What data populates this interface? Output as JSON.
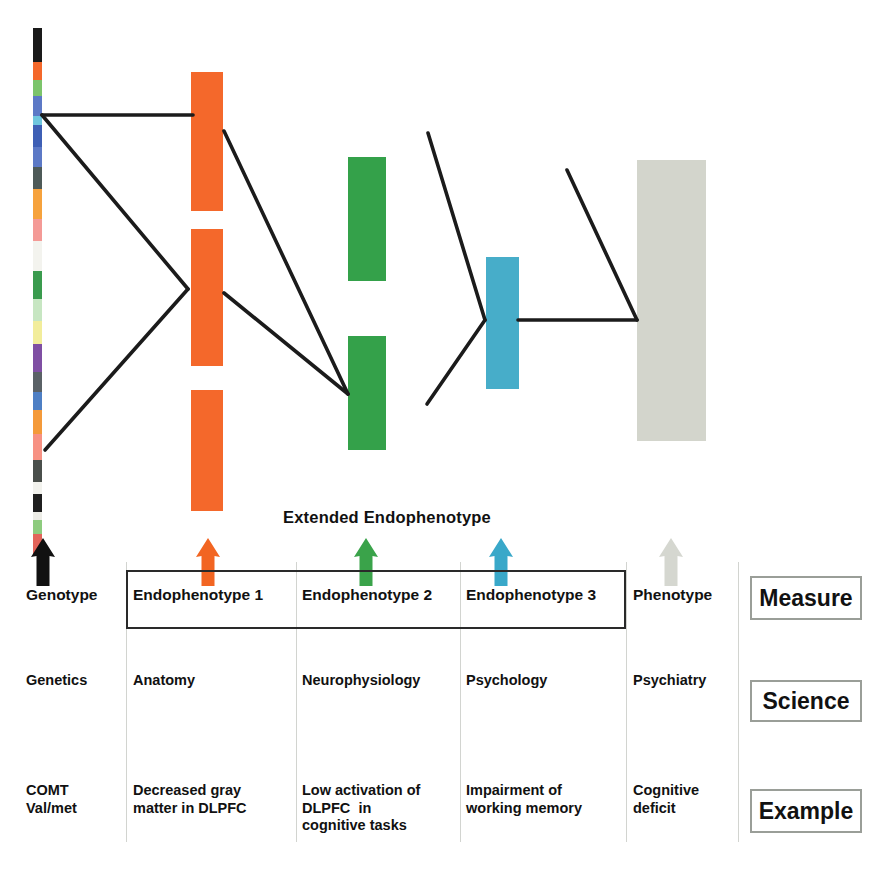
{
  "figure": {
    "title_label": "Extended Endophenotype",
    "columns": [
      {
        "id": "genotype",
        "measure": "Genotype",
        "science": "Genetics",
        "example": "COMT\nVal/met"
      },
      {
        "id": "endophenotype1",
        "measure": "Endophenotype 1",
        "science": "Anatomy",
        "example": "Decreased gray\nmatter in DLPFC"
      },
      {
        "id": "endophenotype2",
        "measure": "Endophenotype 2",
        "science": "Neurophysiology",
        "example": "Low activation of\nDLPFC  in\ncognitive tasks"
      },
      {
        "id": "endophenotype3",
        "measure": "Endophenotype 3",
        "science": "Psychology",
        "example": "Impairment of\nworking memory"
      },
      {
        "id": "phenotype",
        "measure": "Phenotype",
        "science": "Psychiatry",
        "example": "Cognitive\ndeficit"
      }
    ],
    "row_legend": [
      {
        "id": "measure",
        "label": "Measure"
      },
      {
        "id": "science",
        "label": "Science"
      },
      {
        "id": "example",
        "label": "Example"
      }
    ],
    "arrows": [
      {
        "id": "genotype-arrow",
        "color": "#111111",
        "x": 30,
        "y": 538
      },
      {
        "id": "endophenotype1-arrow",
        "color": "#F26522",
        "x": 195,
        "y": 538
      },
      {
        "id": "endophenotype2-arrow",
        "color": "#3AA34A",
        "x": 353,
        "y": 538
      },
      {
        "id": "endophenotype3-arrow",
        "color": "#39A8C9",
        "x": 488,
        "y": 538
      },
      {
        "id": "phenotype-arrow",
        "color": "#D5D7D0",
        "x": 658,
        "y": 538
      }
    ],
    "bars": [
      {
        "id": "endophenotype1-bar-a",
        "color": "#F4682B",
        "x": 191,
        "y": 72,
        "w": 32,
        "h": 139
      },
      {
        "id": "endophenotype1-bar-b",
        "color": "#F4682B",
        "x": 191,
        "y": 229,
        "w": 32,
        "h": 137
      },
      {
        "id": "endophenotype1-bar-c",
        "color": "#F4682B",
        "x": 191,
        "y": 390,
        "w": 32,
        "h": 121
      },
      {
        "id": "endophenotype2-bar-a",
        "color": "#34A14A",
        "x": 348,
        "y": 157,
        "w": 38,
        "h": 124
      },
      {
        "id": "endophenotype2-bar-b",
        "color": "#34A14A",
        "x": 348,
        "y": 336,
        "w": 38,
        "h": 114
      },
      {
        "id": "endophenotype3-bar",
        "color": "#47ADC9",
        "x": 486,
        "y": 257,
        "w": 33,
        "h": 132
      },
      {
        "id": "phenotype-bar",
        "color": "#D3D5CC",
        "x": 637,
        "y": 160,
        "w": 69,
        "h": 281
      }
    ],
    "chromosome_bands": [
      {
        "color": "#1a1a1a",
        "y": 0,
        "h": 34
      },
      {
        "color": "#F4682B",
        "y": 34,
        "h": 18
      },
      {
        "color": "#7CC46B",
        "y": 52,
        "h": 16
      },
      {
        "color": "#5C79C6",
        "y": 68,
        "h": 20
      },
      {
        "color": "#6FC6DE",
        "y": 88,
        "h": 9
      },
      {
        "color": "#3E5FB5",
        "y": 97,
        "h": 22
      },
      {
        "color": "#5C79C6",
        "y": 119,
        "h": 20
      },
      {
        "color": "#4E5A58",
        "y": 139,
        "h": 22
      },
      {
        "color": "#F6A23C",
        "y": 161,
        "h": 30
      },
      {
        "color": "#F49A96",
        "y": 191,
        "h": 22
      },
      {
        "color": "#F3F3EE",
        "y": 213,
        "h": 30
      },
      {
        "color": "#3A9B4E",
        "y": 243,
        "h": 28
      },
      {
        "color": "#C7E6C2",
        "y": 271,
        "h": 22
      },
      {
        "color": "#F2ED9B",
        "y": 293,
        "h": 23
      },
      {
        "color": "#7F4FA3",
        "y": 316,
        "h": 28
      },
      {
        "color": "#5A6166",
        "y": 344,
        "h": 20
      },
      {
        "color": "#4E7FC4",
        "y": 364,
        "h": 18
      },
      {
        "color": "#F49A3A",
        "y": 382,
        "h": 24
      },
      {
        "color": "#F79183",
        "y": 406,
        "h": 26
      },
      {
        "color": "#4A4F4B",
        "y": 432,
        "h": 22
      },
      {
        "color": "#F2F2ED",
        "y": 454,
        "h": 12
      },
      {
        "color": "#1f1f1f",
        "y": 466,
        "h": 18
      },
      {
        "color": "#ECECE6",
        "y": 484,
        "h": 8
      },
      {
        "color": "#8DCB7E",
        "y": 492,
        "h": 14
      },
      {
        "color": "#E2645A",
        "y": 506,
        "h": 21
      }
    ],
    "connectors": [
      {
        "id": "genotype-to-endo1-horizontal",
        "points": "42,115 193,115"
      },
      {
        "id": "genotype-to-endo1-lower",
        "points": "42,115 188,289"
      },
      {
        "id": "genotype-lower-to-endo1",
        "points": "45,450 188,289"
      },
      {
        "id": "endo1-to-endo2-upper",
        "points": "224,131 348,394"
      },
      {
        "id": "endo1-to-endo2-lower",
        "points": "224,293 348,394"
      },
      {
        "id": "endo2-to-endo3-upper",
        "points": "428,133 485,320"
      },
      {
        "id": "endo2-to-endo3-lower",
        "points": "427,404 485,320"
      },
      {
        "id": "endo3-to-phenotype-horizontal",
        "points": "518,320 637,320"
      },
      {
        "id": "endo3-to-phenotype-diagonal",
        "points": "567,170 637,320"
      }
    ],
    "grid": {
      "divider_x": [
        126,
        296,
        460,
        626,
        738
      ],
      "divider_top": 562,
      "divider_bottom": 842
    }
  }
}
